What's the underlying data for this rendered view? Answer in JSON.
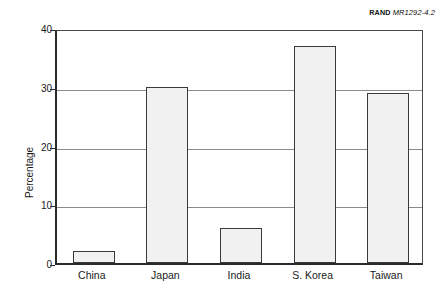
{
  "credit": {
    "mark": "RAND",
    "document": "MR1292-4.2"
  },
  "chart_data": {
    "type": "bar",
    "title": "",
    "xlabel": "",
    "ylabel": "Percentage",
    "categories": [
      "China",
      "Japan",
      "India",
      "S. Korea",
      "Taiwan"
    ],
    "values": [
      2,
      30,
      6,
      37,
      29
    ],
    "ylim": [
      0,
      40
    ],
    "ytick_labels": [
      "0",
      "10",
      "20",
      "30",
      "40"
    ],
    "ytick_values": [
      0,
      10,
      20,
      30,
      40
    ],
    "grid": "horizontal",
    "legend": "none",
    "bar_fill_color": "#f1f1f1",
    "bar_edge_color": "#3a3a3a",
    "axis_color": "#2b2b2b",
    "gridline_color": "#8a8a8a"
  }
}
